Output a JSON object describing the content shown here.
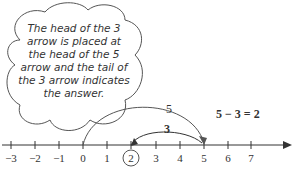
{
  "callout": {
    "text": "The head of the 3 arrow is placed at the head of the 5 arrow and the tail of the 3 arrow indicates the answer."
  },
  "arrows": {
    "big_label": "5",
    "small_label": "3",
    "equation": "5 − 3 = 2"
  },
  "number_line": {
    "ticks": [
      "−3",
      "−2",
      "−1",
      "0",
      "1",
      "2",
      "3",
      "4",
      "5",
      "6",
      "7"
    ],
    "circled": "2"
  }
}
